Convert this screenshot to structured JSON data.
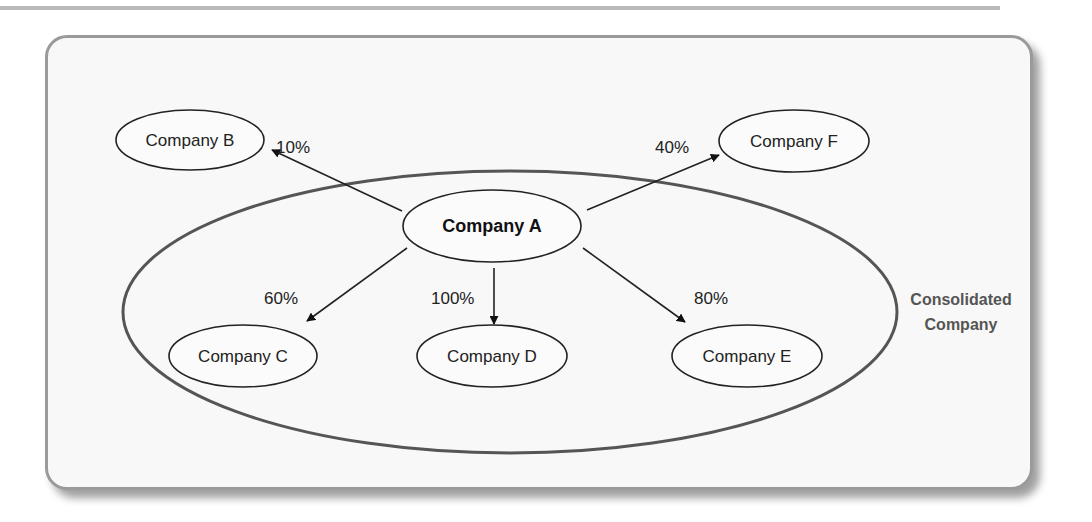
{
  "diagram": {
    "title": "",
    "parent": {
      "label": "Company A"
    },
    "group_label": {
      "line1": "Consolidated",
      "line2": "Company"
    },
    "nodes": {
      "b": {
        "label": "Company B",
        "ownership": "10%"
      },
      "c": {
        "label": "Company C",
        "ownership": "60%"
      },
      "d": {
        "label": "Company D",
        "ownership": "100%"
      },
      "e": {
        "label": "Company E",
        "ownership": "80%"
      },
      "f": {
        "label": "Company F",
        "ownership": "40%"
      }
    },
    "colors": {
      "panel_border": "#9a9a9a",
      "panel_fill": "#f8f8f8",
      "stroke": "#222222",
      "group_stroke": "#555555",
      "group_label": "#555555"
    }
  }
}
